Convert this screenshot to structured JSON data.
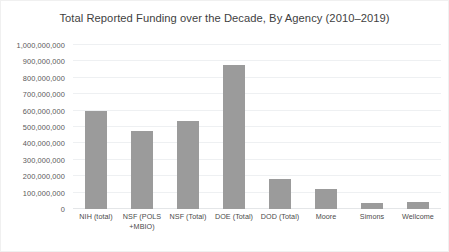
{
  "chart_data": {
    "type": "bar",
    "title": "Total Reported Funding over the Decade, By Agency (2010–2019)",
    "xlabel": "",
    "ylabel": "",
    "categories": [
      "NIH (total)",
      "NSF (POLS +MBIO)",
      "NSF (Total)",
      "DOE (Total)",
      "DOD (Total)",
      "Moore",
      "Simons",
      "Wellcome"
    ],
    "values": [
      600000000,
      475000000,
      535000000,
      880000000,
      180000000,
      120000000,
      35000000,
      40000000
    ],
    "ylim": [
      0,
      1000000000
    ],
    "ytick_values": [
      0,
      100000000,
      200000000,
      300000000,
      400000000,
      500000000,
      600000000,
      700000000,
      800000000,
      900000000,
      1000000000
    ],
    "ytick_labels": [
      "0",
      "100,000,000",
      "200,000,000",
      "300,000,000",
      "400,000,000",
      "500,000,000",
      "600,000,000",
      "700,000,000",
      "800,000,000",
      "900,000,000",
      "1,000,000,000"
    ],
    "grid": true,
    "grid_axis": "y",
    "legend": false,
    "legend_position": "none",
    "bar_color": "#9b9b9b",
    "gridline_color": "#eef0f2",
    "background_color": "#ffffff",
    "title_color": "#3f3f3f",
    "tick_label_color": "#5a5a5a"
  }
}
